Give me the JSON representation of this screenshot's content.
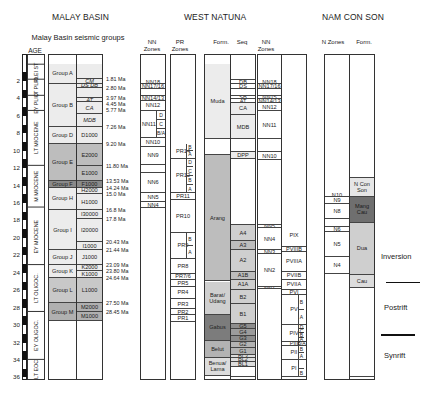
{
  "titles": {
    "malay_basin": "MALAY BASIN",
    "west_natuna": "WEST NATUNA",
    "nam_con_son": "NAM CON SON"
  },
  "headers": {
    "seismic_groups": "Malay Basin seismic groups",
    "age": "AGE",
    "nn_zones_1": "NN Zones",
    "pr_zones": "PR Zones",
    "form_wn": "Form.",
    "seq": "Seq",
    "nn_zones_2": "NN Zones",
    "n_zones": "N Zones",
    "form_ncs": "Form."
  },
  "age_axis": {
    "ticks": [
      "2",
      "4",
      "6",
      "8",
      "10",
      "12",
      "14",
      "16",
      "18",
      "20",
      "22",
      "24",
      "26",
      "28",
      "30",
      "32",
      "34",
      "36"
    ],
    "range": [
      0,
      36
    ],
    "unit": "Ma"
  },
  "epochs": [
    {
      "label": "PLEI ST",
      "from": 0,
      "to": 1.8
    },
    {
      "label": "LT PLIO",
      "from": 1.8,
      "to": 3.6
    },
    {
      "label": "EY PLIO",
      "from": 3.6,
      "to": 5.3
    },
    {
      "label": "LT MIOCENE",
      "from": 5.3,
      "to": 11.6
    },
    {
      "label": "M MIOCENE",
      "from": 11.6,
      "to": 16.4
    },
    {
      "label": "EY MIOCENE",
      "from": 16.4,
      "to": 23.0
    },
    {
      "label": "LT OLIGOC.",
      "from": 23.0,
      "to": 28.4
    },
    {
      "label": "EY OLIGOC.",
      "from": 28.4,
      "to": 33.9
    },
    {
      "label": "LT EOC",
      "from": 33.9,
      "to": 37.0
    }
  ],
  "malay_groups": [
    {
      "label": "Group A",
      "from": 0,
      "to": 2.3,
      "shade": "#ececec"
    },
    {
      "label": "Group B",
      "from": 2.3,
      "to": 7.26,
      "shade": "#ececec"
    },
    {
      "label": "Group D",
      "from": 7.26,
      "to": 9.2,
      "shade": "#ececec"
    },
    {
      "label": "Group E",
      "from": 9.2,
      "to": 13.53,
      "shade": "#bdbdbd"
    },
    {
      "label": "Group F",
      "from": 13.53,
      "to": 14.24,
      "shade": "#8a8a8a"
    },
    {
      "label": "Group H",
      "from": 14.24,
      "to": 16.8,
      "shade": "#ececec"
    },
    {
      "label": "Group I",
      "from": 16.8,
      "to": 21.44,
      "shade": "#ececec"
    },
    {
      "label": "Group J",
      "from": 21.44,
      "to": 23.09,
      "shade": "#ececec"
    },
    {
      "label": "Group K",
      "from": 23.09,
      "to": 24.64,
      "shade": "#ececec"
    },
    {
      "label": "Group L",
      "from": 24.64,
      "to": 27.5,
      "shade": "#c8c8c8"
    },
    {
      "label": "Group M",
      "from": 27.5,
      "to": 29.5,
      "shade": "#b0b0b0"
    }
  ],
  "malay_seq": [
    {
      "label": "",
      "from": 0,
      "to": 1.81,
      "shade": "#ececec",
      "italic": false
    },
    {
      "label": "CM",
      "from": 1.81,
      "to": 2.3,
      "shade": "#ececec",
      "italic": true
    },
    {
      "label": "DS  DB",
      "from": 2.3,
      "to": 2.8,
      "shade": "#ececec",
      "italic": true
    },
    {
      "label": "",
      "from": 2.8,
      "to": 3.97,
      "shade": "#ececec",
      "italic": false
    },
    {
      "label": "AT",
      "from": 3.97,
      "to": 4.45,
      "shade": "#ececec",
      "italic": true
    },
    {
      "label": "CA",
      "from": 4.45,
      "to": 5.77,
      "shade": "#ececec",
      "italic": true
    },
    {
      "label": "MDB",
      "from": 5.77,
      "to": 7.26,
      "shade": "#ececec",
      "italic": true
    },
    {
      "label": "D1000",
      "from": 7.26,
      "to": 9.2,
      "shade": "#ececec",
      "italic": false
    },
    {
      "label": "E2000",
      "from": 9.2,
      "to": 11.8,
      "shade": "#bdbdbd",
      "italic": false
    },
    {
      "label": "E1000",
      "from": 11.8,
      "to": 13.53,
      "shade": "#bdbdbd",
      "italic": false
    },
    {
      "label": "F1000",
      "from": 13.53,
      "to": 14.24,
      "shade": "#8a8a8a",
      "italic": false
    },
    {
      "label": "H2000",
      "from": 14.24,
      "to": 15.0,
      "shade": "#ececec",
      "italic": false
    },
    {
      "label": "H1000",
      "from": 15.0,
      "to": 16.8,
      "shade": "#ececec",
      "italic": false
    },
    {
      "label": "I30000",
      "from": 16.8,
      "to": 17.8,
      "shade": "#ececec",
      "italic": false
    },
    {
      "label": "I20000",
      "from": 17.8,
      "to": 20.43,
      "shade": "#ececec",
      "italic": false
    },
    {
      "label": "I1000",
      "from": 20.43,
      "to": 21.44,
      "shade": "#ececec",
      "italic": false
    },
    {
      "label": "J1000",
      "from": 21.44,
      "to": 23.09,
      "shade": "#ececec",
      "italic": false
    },
    {
      "label": "K2000",
      "from": 23.09,
      "to": 23.8,
      "shade": "#ececec",
      "italic": false
    },
    {
      "label": "K1000",
      "from": 23.8,
      "to": 24.64,
      "shade": "#ececec",
      "italic": false
    },
    {
      "label": "L1000",
      "from": 24.64,
      "to": 27.5,
      "shade": "#c8c8c8",
      "italic": false
    },
    {
      "label": "M2000",
      "from": 27.5,
      "to": 28.45,
      "shade": "#b0b0b0",
      "italic": false
    },
    {
      "label": "M1000",
      "from": 28.45,
      "to": 29.5,
      "shade": "#b0b0b0",
      "italic": false
    }
  ],
  "ma_labels": [
    {
      "label": "1.81 Ma",
      "at": 1.81
    },
    {
      "label": "2.80 Ma",
      "at": 2.8
    },
    {
      "label": "3.97 Ma",
      "at": 3.97
    },
    {
      "label": "4.45 Ma",
      "at": 4.6
    },
    {
      "label": "5.77 Ma",
      "at": 5.3
    },
    {
      "label": "7.26 Ma",
      "at": 7.26
    },
    {
      "label": "9.20 Ma",
      "at": 9.2
    },
    {
      "label": "11.80 Ma",
      "at": 11.8
    },
    {
      "label": "13.53 Ma",
      "at": 13.53
    },
    {
      "label": "14.24 Ma",
      "at": 14.24
    },
    {
      "label": "15.0 Ma",
      "at": 14.95
    },
    {
      "label": "16.8 Ma",
      "at": 16.8
    },
    {
      "label": "17.8 Ma",
      "at": 17.8
    },
    {
      "label": "20.43 Ma",
      "at": 20.43
    },
    {
      "label": "21.44 Ma",
      "at": 21.44
    },
    {
      "label": "23.09 Ma",
      "at": 23.09
    },
    {
      "label": "23.80 Ma",
      "at": 23.8
    },
    {
      "label": "24.64 Ma",
      "at": 24.64
    },
    {
      "label": "27.50 Ma",
      "at": 27.5
    },
    {
      "label": "28.45 Ma",
      "at": 28.45
    }
  ],
  "wn_nn_zones": [
    {
      "label": "NN18",
      "from": 1.9,
      "to": 2.4
    },
    {
      "label": "NN17/16",
      "from": 2.4,
      "to": 2.9
    },
    {
      "label": "",
      "from": 2.9,
      "to": 3.7
    },
    {
      "label": "NN14/13",
      "from": 3.7,
      "to": 4.3
    },
    {
      "label": "NN12",
      "from": 4.3,
      "to": 5.4
    },
    {
      "label": "NN11",
      "from": 5.4,
      "to": 8.5
    },
    {
      "label": "NN10",
      "from": 8.5,
      "to": 9.6
    },
    {
      "label": "NN9",
      "from": 9.6,
      "to": 11.6
    },
    {
      "label": "",
      "from": 11.6,
      "to": 12.6
    },
    {
      "label": "NN6",
      "from": 12.6,
      "to": 14.8
    },
    {
      "label": "NN5",
      "from": 14.8,
      "to": 15.9
    },
    {
      "label": "NN4",
      "from": 15.9,
      "to": 16.6
    }
  ],
  "wn_nn11_subs": [
    "D",
    "C",
    "B/A"
  ],
  "pr_zones": [
    {
      "label": "PR14",
      "from": 9.2,
      "to": 10.9,
      "subs": [
        "B",
        "A"
      ]
    },
    {
      "label": "PR12",
      "from": 10.9,
      "to": 14.9,
      "subs": [
        "D",
        "C",
        "B",
        "A"
      ]
    },
    {
      "label": "PR11",
      "from": 14.9,
      "to": 15.6,
      "subs": []
    },
    {
      "label": "PR10",
      "from": 15.6,
      "to": 19.4,
      "subs": []
    },
    {
      "label": "PR9",
      "from": 19.4,
      "to": 22.4,
      "subs": [
        "B",
        "A"
      ]
    },
    {
      "label": "PR8",
      "from": 22.4,
      "to": 24.1,
      "subs": []
    },
    {
      "label": "PR7/6",
      "from": 24.1,
      "to": 24.8,
      "subs": []
    },
    {
      "label": "PR5",
      "from": 24.8,
      "to": 25.6,
      "subs": []
    },
    {
      "label": "PR4",
      "from": 25.6,
      "to": 27.0,
      "subs": []
    },
    {
      "label": "PR3",
      "from": 27.0,
      "to": 28.2,
      "subs": []
    },
    {
      "label": "PR2",
      "from": 28.2,
      "to": 28.9,
      "subs": []
    },
    {
      "label": "PR1",
      "from": 28.9,
      "to": 29.7,
      "subs": []
    }
  ],
  "wn_formations": [
    {
      "label": "Muda",
      "from": 0,
      "to": 8.7,
      "shade": "#ececec",
      "color": "#222"
    },
    {
      "label": "",
      "from": 8.7,
      "to": 10.5,
      "shade": "#ffffff",
      "color": "#222"
    },
    {
      "label": "Arang",
      "from": 10.5,
      "to": 25.0,
      "shade": "#bdbdbd",
      "color": "#222"
    },
    {
      "label": "Barat/ Udang",
      "from": 25.0,
      "to": 28.8,
      "shade": "#cfcfcf",
      "color": "#222"
    },
    {
      "label": "Gabus",
      "from": 28.8,
      "to": 31.8,
      "shade": "#7c7c7c",
      "color": "#333"
    },
    {
      "label": "Belut",
      "from": 31.8,
      "to": 33.8,
      "shade": "#b3b3b3",
      "color": "#222"
    },
    {
      "label": "Benua/ Lama",
      "from": 33.8,
      "to": 35.8,
      "shade": "#dcdcdc",
      "color": "#222"
    }
  ],
  "wn_seq": [
    {
      "label": "",
      "from": 0,
      "to": 1.9,
      "shade": "#ffffff"
    },
    {
      "label": "DB",
      "from": 1.9,
      "to": 2.4,
      "shade": "#ffffff"
    },
    {
      "label": "DS",
      "from": 2.4,
      "to": 2.9,
      "shade": "#ffffff"
    },
    {
      "label": "",
      "from": 2.9,
      "to": 3.7,
      "shade": "#ffffff"
    },
    {
      "label": "SB",
      "from": 3.7,
      "to": 4.1,
      "shade": "#ffffff"
    },
    {
      "label": "AT",
      "from": 4.1,
      "to": 4.5,
      "shade": "#ffffff"
    },
    {
      "label": "CA",
      "from": 4.5,
      "to": 5.9,
      "shade": "#ececec"
    },
    {
      "label": "MDB",
      "from": 5.9,
      "to": 8.7,
      "shade": "#ececec"
    },
    {
      "label": "",
      "from": 8.7,
      "to": 10.2,
      "shade": "#ffffff"
    },
    {
      "label": "DPP",
      "from": 10.2,
      "to": 10.9,
      "shade": "#ececec"
    },
    {
      "label": "",
      "from": 10.9,
      "to": 18.5,
      "shade": "#ffffff"
    },
    {
      "label": "A4",
      "from": 18.5,
      "to": 20.4,
      "shade": "#cfcfcf"
    },
    {
      "label": "A3",
      "from": 20.4,
      "to": 21.4,
      "shade": "#bdbdbd"
    },
    {
      "label": "A2",
      "from": 21.4,
      "to": 23.9,
      "shade": "#cfcfcf"
    },
    {
      "label": "A1B",
      "from": 23.9,
      "to": 24.8,
      "shade": "#bdbdbd"
    },
    {
      "label": "A1A",
      "from": 24.8,
      "to": 26.0,
      "shade": "#cfcfcf"
    },
    {
      "label": "B2",
      "from": 26.0,
      "to": 27.6,
      "shade": "#cfcfcf"
    },
    {
      "label": "B1",
      "from": 27.6,
      "to": 29.9,
      "shade": "#cfcfcf"
    },
    {
      "label": "G5",
      "from": 29.9,
      "to": 30.5,
      "shade": "#8d8d8d"
    },
    {
      "label": "G4",
      "from": 30.5,
      "to": 31.2,
      "shade": "#9c9c9c"
    },
    {
      "label": "G3",
      "from": 31.2,
      "to": 31.9,
      "shade": "#8d8d8d"
    },
    {
      "label": "G2",
      "from": 31.9,
      "to": 32.6,
      "shade": "#b3b3b3"
    },
    {
      "label": "G1",
      "from": 32.6,
      "to": 33.4,
      "shade": "#b3b3b3"
    },
    {
      "label": "BL3",
      "from": 33.4,
      "to": 33.8,
      "shade": "#dcdcdc"
    },
    {
      "label": "BL2",
      "from": 33.8,
      "to": 34.2,
      "shade": "#dcdcdc"
    },
    {
      "label": "BL1",
      "from": 34.2,
      "to": 34.8,
      "shade": "#dcdcdc"
    },
    {
      "label": "",
      "from": 34.8,
      "to": 36.0,
      "shade": "#ffffff"
    }
  ],
  "wn_nn_zones_2": [
    {
      "label": "NN18",
      "from": 1.9,
      "to": 2.4
    },
    {
      "label": "NN17/16",
      "from": 2.4,
      "to": 2.9
    },
    {
      "label": "",
      "from": 2.9,
      "to": 3.7
    },
    {
      "label": "NN15",
      "from": 3.7,
      "to": 4.1
    },
    {
      "label": "NN14/13",
      "from": 4.1,
      "to": 4.5
    },
    {
      "label": "NN12",
      "from": 4.5,
      "to": 5.5
    },
    {
      "label": "NN11",
      "from": 5.5,
      "to": 8.7
    },
    {
      "label": "",
      "from": 8.7,
      "to": 10.2
    },
    {
      "label": "NN10",
      "from": 10.2,
      "to": 11.1
    },
    {
      "label": "",
      "from": 11.1,
      "to": 18.5
    },
    {
      "label": "NN5",
      "from": 18.5,
      "to": 18.9
    },
    {
      "label": "NN4",
      "from": 18.9,
      "to": 21.4
    },
    {
      "label": "NN3",
      "from": 21.4,
      "to": 21.9
    },
    {
      "label": "NN2",
      "from": 21.9,
      "to": 25.6
    },
    {
      "label": "NN1",
      "from": 25.6,
      "to": 25.9
    }
  ],
  "palyno_zones": [
    {
      "label": "PIX",
      "from": 18.5,
      "to": 21.0,
      "subs": []
    },
    {
      "label": "PVIIIB",
      "from": 21.0,
      "to": 21.6,
      "subs": []
    },
    {
      "label": "PVIIIA",
      "from": 21.6,
      "to": 23.9,
      "subs": []
    },
    {
      "label": "PVIIB",
      "from": 23.9,
      "to": 24.8,
      "subs": []
    },
    {
      "label": "PVIIA",
      "from": 24.8,
      "to": 26.0,
      "subs": []
    },
    {
      "label": "PVI",
      "from": 26.0,
      "to": 26.5,
      "subs": []
    },
    {
      "label": "PV",
      "from": 26.5,
      "to": 30.0,
      "subs": [
        "B",
        "A"
      ]
    },
    {
      "label": "PIV",
      "from": 30.0,
      "to": 31.9,
      "subs": [
        "D",
        "C",
        "B",
        "A"
      ]
    },
    {
      "label": "PIII",
      "from": 31.9,
      "to": 32.4,
      "subs": [
        "B/A"
      ]
    },
    {
      "label": "PII",
      "from": 32.4,
      "to": 34.0,
      "subs": [
        "B",
        "A"
      ]
    },
    {
      "label": "PI",
      "from": 34.0,
      "to": 36.0,
      "subs": [
        "",
        "B"
      ]
    }
  ],
  "ncs_n_zones": [
    {
      "label": "N10",
      "from": 14.9,
      "to": 15.3
    },
    {
      "label": "N9",
      "from": 15.3,
      "to": 16.1
    },
    {
      "label": "N8",
      "from": 16.1,
      "to": 17.8
    },
    {
      "label": "",
      "from": 17.8,
      "to": 18.7
    },
    {
      "label": "N6",
      "from": 18.7,
      "to": 19.3
    },
    {
      "label": "N5",
      "from": 19.3,
      "to": 22.2
    },
    {
      "label": "N4",
      "from": 22.2,
      "to": 24.1
    }
  ],
  "ncs_formations": [
    {
      "label": "",
      "from": 0,
      "to": 13.1,
      "shade": "#ffffff",
      "color": "#222"
    },
    {
      "label": "N Con Son",
      "from": 13.1,
      "to": 15.3,
      "shade": "#e6e6e6",
      "color": "#222"
    },
    {
      "label": "Mang Cau",
      "from": 15.3,
      "to": 18.3,
      "shade": "#6f6f6f",
      "color": "#222"
    },
    {
      "label": "Dua",
      "from": 18.3,
      "to": 24.2,
      "shade": "#cfcfcf",
      "color": "#222"
    },
    {
      "label": "Cau",
      "from": 24.2,
      "to": 25.7,
      "shade": "#dcdcdc",
      "color": "#222"
    },
    {
      "label": "",
      "from": 25.7,
      "to": 36.0,
      "shade": "#ffffff",
      "color": "#222"
    }
  ],
  "tectonics": [
    {
      "label": "Inversion",
      "label_at": 22.2
    },
    {
      "label": "Postrift",
      "label_at": 28.0
    },
    {
      "label": "Synrift",
      "label_at": 33.6
    }
  ],
  "tectonic_bars": [
    25.0,
    31.0
  ]
}
